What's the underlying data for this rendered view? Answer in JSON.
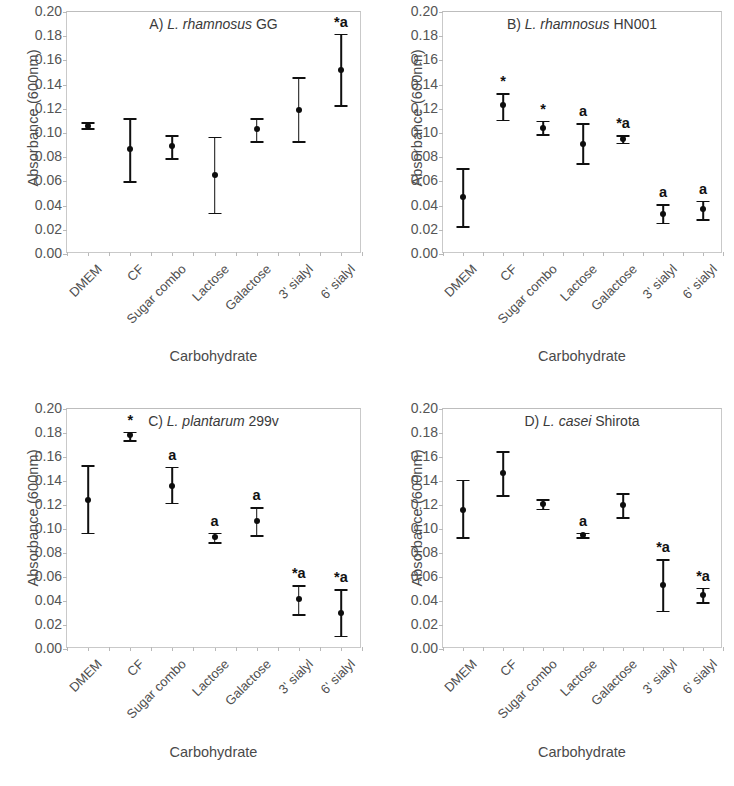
{
  "figure": {
    "axis_title_y": "Absorbance (600nm)",
    "axis_title_x": "Carbohydrate",
    "ytick_labels": [
      "0.20",
      "0.18",
      "0.16",
      "0.14",
      "0.12",
      "0.10",
      "0.08",
      "0.06",
      "0.04",
      "0.02",
      "0.00"
    ],
    "categories": [
      "DMEM",
      "CF",
      "Sugar combo",
      "Lactose",
      "Galactose",
      "3' sialyl",
      "6' sialyl"
    ]
  },
  "chart_data": [
    {
      "type": "scatter",
      "panel": "A",
      "title_prefix": "A)",
      "title_species": "L. rhamnosus",
      "title_strain": "GG",
      "title": "A) L. rhamnosus GG",
      "xlabel": "Carbohydrate",
      "ylabel": "Absorbance (600nm)",
      "ylim": [
        0.0,
        0.2
      ],
      "ytick_step": 0.02,
      "grid": false,
      "legend": "none",
      "categories": [
        "DMEM",
        "CF",
        "Sugar combo",
        "Lactose",
        "Galactose",
        "3' sialyl",
        "6' sialyl"
      ],
      "values": [
        0.106,
        0.087,
        0.089,
        0.065,
        0.103,
        0.119,
        0.152
      ],
      "err_low": [
        0.104,
        0.06,
        0.079,
        0.034,
        0.093,
        0.093,
        0.123
      ],
      "err_high": [
        0.109,
        0.112,
        0.098,
        0.097,
        0.112,
        0.146,
        0.182
      ],
      "annotations": [
        "",
        "",
        "",
        "",
        "",
        "",
        "*a"
      ]
    },
    {
      "type": "scatter",
      "panel": "B",
      "title_prefix": "B)",
      "title_species": "L. rhamnosus",
      "title_strain": "HN001",
      "title": "B) L. rhamnosus HN001",
      "xlabel": "Carbohydrate",
      "ylabel": "Absorbance (600nm)",
      "ylim": [
        0.0,
        0.2
      ],
      "ytick_step": 0.02,
      "grid": false,
      "legend": "none",
      "categories": [
        "DMEM",
        "CF",
        "Sugar combo",
        "Lactose",
        "Galactose",
        "3' sialyl",
        "6' sialyl"
      ],
      "values": [
        0.047,
        0.123,
        0.104,
        0.091,
        0.095,
        0.033,
        0.037
      ],
      "err_low": [
        0.023,
        0.111,
        0.099,
        0.075,
        0.092,
        0.026,
        0.029
      ],
      "err_high": [
        0.071,
        0.133,
        0.11,
        0.108,
        0.098,
        0.041,
        0.044
      ],
      "annotations": [
        "",
        "*",
        "*",
        "a",
        "*a",
        "a",
        "a"
      ]
    },
    {
      "type": "scatter",
      "panel": "C",
      "title_prefix": "C)",
      "title_species": "L. plantarum",
      "title_strain": "299v",
      "title": "C) L. plantarum 299v",
      "xlabel": "Carbohydrate",
      "ylabel": "Absorbance (600nm)",
      "ylim": [
        0.0,
        0.2
      ],
      "ytick_step": 0.02,
      "grid": false,
      "legend": "none",
      "categories": [
        "DMEM",
        "CF",
        "Sugar combo",
        "Lactose",
        "Galactose",
        "3' sialyl",
        "6' sialyl"
      ],
      "values": [
        0.124,
        0.178,
        0.136,
        0.093,
        0.107,
        0.042,
        0.03
      ],
      "err_low": [
        0.097,
        0.174,
        0.122,
        0.089,
        0.095,
        0.029,
        0.011
      ],
      "err_high": [
        0.153,
        0.181,
        0.152,
        0.097,
        0.118,
        0.053,
        0.05
      ],
      "annotations": [
        "",
        "*",
        "a",
        "a",
        "a",
        "*a",
        "*a"
      ]
    },
    {
      "type": "scatter",
      "panel": "D",
      "title_prefix": "D)",
      "title_species": "L. casei",
      "title_strain": "Shirota",
      "title": "D) L. casei Shirota",
      "xlabel": "Carbohydrate",
      "ylabel": "Absorbance (600nm)",
      "ylim": [
        0.0,
        0.2
      ],
      "ytick_step": 0.02,
      "grid": false,
      "legend": "none",
      "categories": [
        "DMEM",
        "CF",
        "Sugar combo",
        "Lactose",
        "Galactose",
        "3' sialyl",
        "6' sialyl"
      ],
      "values": [
        0.116,
        0.147,
        0.121,
        0.095,
        0.12,
        0.053,
        0.045
      ],
      "err_low": [
        0.093,
        0.128,
        0.117,
        0.093,
        0.11,
        0.032,
        0.039
      ],
      "err_high": [
        0.141,
        0.165,
        0.125,
        0.097,
        0.13,
        0.075,
        0.051
      ],
      "annotations": [
        "",
        "",
        "",
        "a",
        "",
        "*a",
        "*a"
      ]
    }
  ]
}
